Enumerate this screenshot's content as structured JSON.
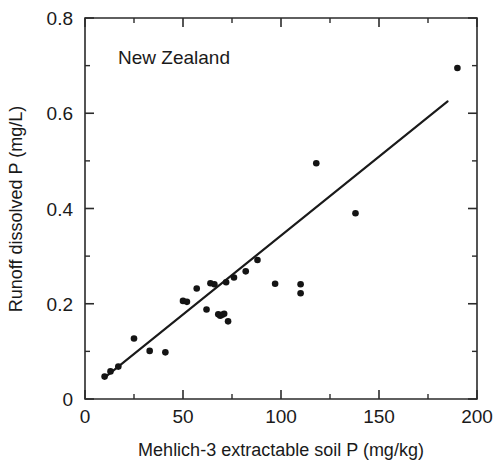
{
  "chart_data": {
    "type": "scatter",
    "title": "",
    "annotation": "New Zealand",
    "xlabel": "Mehlich-3 extractable soil P (mg/kg)",
    "ylabel": "Runoff dissolved P (mg/L)",
    "xlim": [
      0,
      200
    ],
    "ylim": [
      0,
      0.8
    ],
    "xticks": [
      0,
      50,
      100,
      150,
      200
    ],
    "xtick_labels": [
      "0",
      "50",
      "100",
      "150",
      "200"
    ],
    "xticks_minor": [
      25,
      75,
      125,
      175
    ],
    "yticks": [
      0,
      0.2,
      0.4,
      0.6,
      0.8
    ],
    "ytick_labels": [
      "0",
      "0.2",
      "0.4",
      "0.6",
      "0.8"
    ],
    "yticks_minor": [
      0.1,
      0.3,
      0.5,
      0.7
    ],
    "grid": false,
    "legend": false,
    "marker": "filled-circle",
    "marker_color": "#141414",
    "series": [
      {
        "name": "New Zealand sites",
        "points": [
          [
            10,
            0.047
          ],
          [
            13,
            0.058
          ],
          [
            17,
            0.068
          ],
          [
            25,
            0.127
          ],
          [
            33,
            0.101
          ],
          [
            41,
            0.098
          ],
          [
            50,
            0.206
          ],
          [
            52,
            0.204
          ],
          [
            57,
            0.232
          ],
          [
            62,
            0.188
          ],
          [
            64,
            0.243
          ],
          [
            66,
            0.241
          ],
          [
            68,
            0.178
          ],
          [
            69,
            0.175
          ],
          [
            70,
            0.177
          ],
          [
            71,
            0.179
          ],
          [
            72,
            0.245
          ],
          [
            73,
            0.163
          ],
          [
            76,
            0.255
          ],
          [
            82,
            0.268
          ],
          [
            88,
            0.292
          ],
          [
            97,
            0.242
          ],
          [
            110,
            0.241
          ],
          [
            110,
            0.222
          ],
          [
            118,
            0.495
          ],
          [
            138,
            0.39
          ],
          [
            190,
            0.695
          ]
        ]
      }
    ],
    "fit_line": {
      "name": "regression line",
      "x_start": 10,
      "y_start": 0.045,
      "x_end": 185,
      "y_end": 0.625
    }
  }
}
